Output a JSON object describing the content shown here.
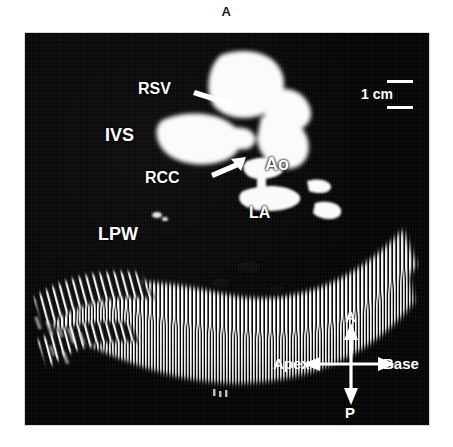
{
  "figure": {
    "panel_letter": "A",
    "modality": "2D echocardiogram, parasternal long-axis view"
  },
  "scale_bar": {
    "label": "1 cm"
  },
  "annotations": [
    {
      "id": "rsv",
      "label": "RSV",
      "meaning": "right sinus of Valsalva",
      "has_arrow": true
    },
    {
      "id": "ivs",
      "label": "IVS",
      "meaning": "interventricular septum",
      "has_arrow": false
    },
    {
      "id": "rcc",
      "label": "RCC",
      "meaning": "right coronary cusp",
      "has_arrow": true
    },
    {
      "id": "ao",
      "label": "Ao",
      "meaning": "aorta",
      "has_arrow": false
    },
    {
      "id": "la",
      "label": "LA",
      "meaning": "left atrium",
      "has_arrow": false
    },
    {
      "id": "lpw",
      "label": "LPW",
      "meaning": "left posterior wall",
      "has_arrow": false
    }
  ],
  "orientation": {
    "top": "A",
    "bottom": "P",
    "left": "Apex",
    "right": "Base"
  },
  "colors": {
    "background": "#ffffff",
    "scan_background": "#050505",
    "tissue": "#ffffff",
    "annotation": "#ffffff",
    "panel_letter": "#1a1a1a"
  }
}
